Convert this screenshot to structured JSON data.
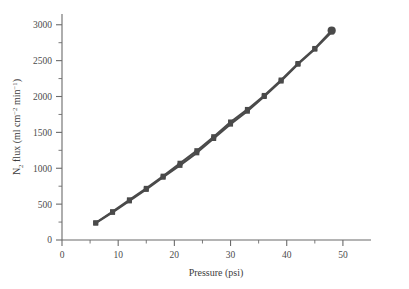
{
  "chart_data": {
    "type": "line",
    "title": "",
    "subtitle": "",
    "xlabel": "Pressure (psi)",
    "ylabel": "N2 flux (ml cm-2 min-1)",
    "ylabel_parts": {
      "lead": "N",
      "sub1": "2",
      "mid": " flux (ml cm",
      "sup1": "−2",
      "mid2": " min",
      "sup2": "−1",
      "tail": ")"
    },
    "xlim": [
      0,
      55
    ],
    "ylim": [
      0,
      3150
    ],
    "xticks": [
      0,
      10,
      20,
      30,
      40,
      50
    ],
    "xtick_labels": [
      "0",
      "10",
      "20",
      "30",
      "40",
      "50"
    ],
    "xminor_ticks": [
      5,
      15,
      25,
      35,
      45
    ],
    "yticks": [
      0,
      500,
      1000,
      1500,
      2000,
      2500,
      3000
    ],
    "ytick_labels": [
      "0",
      "500",
      "1000",
      "1500",
      "2000",
      "2500",
      "3000"
    ],
    "yminor_ticks": [
      250,
      750,
      1250,
      1750,
      2250,
      2750
    ],
    "grid": false,
    "legend": false,
    "legend_position": "none",
    "spines": [
      "left",
      "bottom"
    ],
    "marker": "square",
    "marker_size": 5,
    "line_width": 2,
    "color": "#4a4a4a",
    "series": [
      {
        "name": "N2 flux run 1",
        "marker": "square",
        "x": [
          6,
          9,
          12,
          15,
          18,
          21,
          24,
          27,
          30,
          33,
          36,
          39,
          42,
          45,
          48
        ],
        "values": [
          240,
          395,
          560,
          720,
          890,
          1070,
          1245,
          1440,
          1645,
          1820,
          2015,
          2230,
          2460,
          2670,
          2920
        ]
      },
      {
        "name": "N2 flux run 2",
        "marker": "square",
        "x": [
          6,
          9,
          12,
          15,
          18,
          21,
          24,
          27,
          30,
          33,
          36,
          39,
          42,
          45,
          48
        ],
        "values": [
          235,
          385,
          545,
          705,
          875,
          1040,
          1215,
          1415,
          1615,
          1795,
          2000,
          2215,
          2450,
          2660,
          2900
        ]
      }
    ]
  },
  "colors": {
    "axis": "#6b6b6b",
    "data": "#4a4a4a",
    "text": "#3c3c3c",
    "background": "#ffffff"
  }
}
